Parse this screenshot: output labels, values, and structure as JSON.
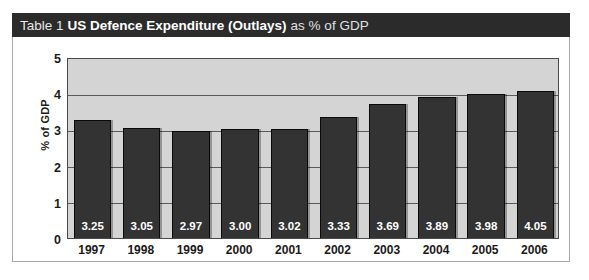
{
  "title": {
    "prefix": "Table 1",
    "emphasis": "US Defence Expenditure (Outlays)",
    "suffix": "as % of GDP",
    "bar_color": "#2b2b2b",
    "text_color": "#ffffff"
  },
  "chart_data": {
    "type": "bar",
    "title": "Table 1 US Defence Expenditure (Outlays) as % of GDP",
    "xlabel": "",
    "ylabel": "% of GDP",
    "categories": [
      "1997",
      "1998",
      "1999",
      "2000",
      "2001",
      "2002",
      "2003",
      "2004",
      "2005",
      "2006"
    ],
    "values": [
      3.25,
      3.05,
      2.97,
      3.0,
      3.02,
      3.33,
      3.69,
      3.89,
      3.98,
      4.05
    ],
    "value_labels": [
      "3.25",
      "3.05",
      "2.97",
      "3.00",
      "3.02",
      "3.33",
      "3.69",
      "3.89",
      "3.98",
      "4.05"
    ],
    "ylim": [
      0,
      5
    ],
    "yticks": [
      0,
      1,
      2,
      3,
      4,
      5
    ],
    "ytick_labels": [
      "0",
      "1",
      "2",
      "3",
      "4",
      "5"
    ],
    "grid": true,
    "legend": null,
    "plot_background": "#d4d4d4",
    "bar_color": "#333333",
    "gridline_color": "#5a5a5a",
    "value_label_color": "#ffffff"
  }
}
